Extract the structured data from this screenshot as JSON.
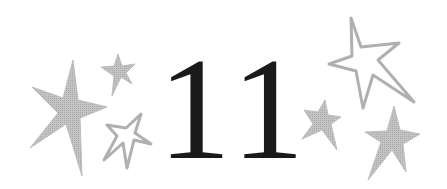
{
  "chapter": {
    "number": "11",
    "text_color": "#1a1a1a"
  },
  "decorations": {
    "star_color": "#b5b5b5",
    "stars": [
      {
        "name": "left-large-filled-star",
        "style": "filled"
      },
      {
        "name": "left-small-filled-star",
        "style": "filled"
      },
      {
        "name": "left-outline-star",
        "style": "outline"
      },
      {
        "name": "right-large-outline-star",
        "style": "outline"
      },
      {
        "name": "right-small-filled-star",
        "style": "filled"
      },
      {
        "name": "right-bottom-filled-star",
        "style": "filled"
      }
    ]
  }
}
